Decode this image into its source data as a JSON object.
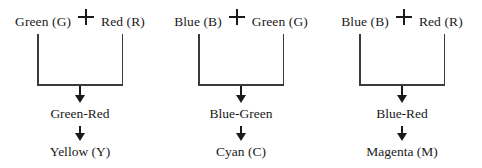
{
  "diagram": {
    "type": "flowchart",
    "title": "",
    "operator_symbol": "+",
    "arrow_symbol": "downward-arrow",
    "colors": {
      "text": "#1a1a1a",
      "line": "#3a3a3a",
      "background": "#ffffff"
    },
    "groups": [
      {
        "id": "green-red-yellow",
        "input_left": "Green (G)",
        "operator": "+",
        "input_right": "Red (R)",
        "intermediate": "Green-Red",
        "result": "Yellow (Y)"
      },
      {
        "id": "blue-green-cyan",
        "input_left": "Blue (B)",
        "operator": "+",
        "input_right": "Green (G)",
        "intermediate": "Blue-Green",
        "result": "Cyan (C)"
      },
      {
        "id": "blue-red-magenta",
        "input_left": "Blue (B)",
        "operator": "+",
        "input_right": "Red (R)",
        "intermediate": "Blue-Red",
        "result": "Magenta (M)"
      }
    ]
  }
}
